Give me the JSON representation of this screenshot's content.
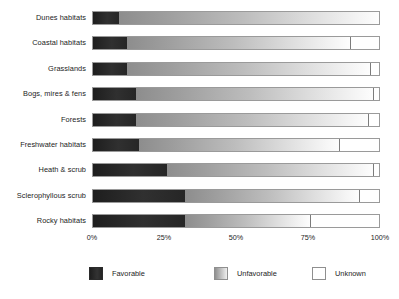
{
  "chart_data": {
    "type": "bar",
    "orientation": "horizontal",
    "stacked": true,
    "normalized": true,
    "title": "",
    "subtitle": "",
    "xlabel": "",
    "ylabel": "",
    "xlim": [
      0,
      100
    ],
    "grid": false,
    "legend_position": "bottom",
    "categories": [
      "Dunes habitats",
      "Coastal habitats",
      "Grasslands",
      "Bogs, mires & fens",
      "Forests",
      "Freshwater habitats",
      "Heath & scrub",
      "Sclerophyllous scrub",
      "Rocky habitats"
    ],
    "xticks": [
      0,
      25,
      50,
      75,
      100
    ],
    "xticklabels": [
      "0%",
      "25%",
      "50%",
      "75%",
      "100%"
    ],
    "series": [
      {
        "name": "Favorable",
        "color": "#2b2b2b",
        "values": [
          9,
          12,
          12,
          15,
          15,
          16,
          26,
          32,
          32
        ]
      },
      {
        "name": "Unfavorable",
        "color": "#b5b5b5",
        "values": [
          91,
          78,
          85,
          83,
          81,
          70,
          72,
          61,
          44
        ]
      },
      {
        "name": "Unknown",
        "color": "#ffffff",
        "values": [
          0,
          10,
          3,
          2,
          4,
          14,
          2,
          7,
          24
        ]
      }
    ]
  },
  "legend": {
    "items": [
      {
        "label": "Favorable",
        "swatch": "favorable"
      },
      {
        "label": "Unfavorable",
        "swatch": "unfavorable"
      },
      {
        "label": "Unknown",
        "swatch": "unknown"
      }
    ]
  }
}
